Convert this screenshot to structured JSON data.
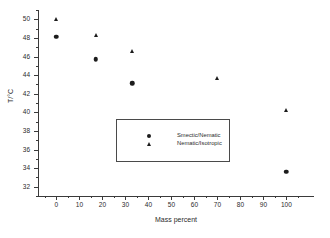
{
  "chart_data": {
    "type": "scatter",
    "title": "",
    "xlabel": "Mass percent",
    "ylabel": "T/°C",
    "xlim": [
      -8,
      112
    ],
    "ylim": [
      31,
      51
    ],
    "xticks": [
      0,
      10,
      20,
      30,
      40,
      50,
      60,
      70,
      80,
      90,
      100
    ],
    "yticks": [
      32,
      34,
      36,
      38,
      40,
      42,
      44,
      46,
      48,
      50
    ],
    "xtick_labels": [
      "0",
      "10",
      "20",
      "30",
      "40",
      "50",
      "60",
      "70",
      "80",
      "90",
      "100"
    ],
    "ytick_labels": [
      "32",
      "34",
      "36",
      "38",
      "40",
      "42",
      "44",
      "46",
      "48",
      "50"
    ],
    "grid": false,
    "legend_position": "center-left",
    "series": [
      {
        "name": "Smectic/Nematic",
        "marker": "circle",
        "color": "#1c1c1c",
        "points": [
          {
            "x": 0,
            "y": 48.1
          },
          {
            "x": 17,
            "y": 45.7
          },
          {
            "x": 33,
            "y": 43.1
          },
          {
            "x": 70,
            "y": 38.1
          },
          {
            "x": 100,
            "y": 33.6
          }
        ]
      },
      {
        "name": "Nematic/Isotropic",
        "marker": "triangle",
        "color": "#1c1c1c",
        "points": [
          {
            "x": 0,
            "y": 50.0
          },
          {
            "x": 17,
            "y": 48.3
          },
          {
            "x": 33,
            "y": 46.6
          },
          {
            "x": 70,
            "y": 43.7
          },
          {
            "x": 100,
            "y": 40.2
          }
        ]
      }
    ]
  },
  "legend": {
    "entries": [
      {
        "label": "Smectic/Nematic",
        "marker": "circle"
      },
      {
        "label": "Nematic/Isotropic",
        "marker": "triangle"
      }
    ]
  }
}
